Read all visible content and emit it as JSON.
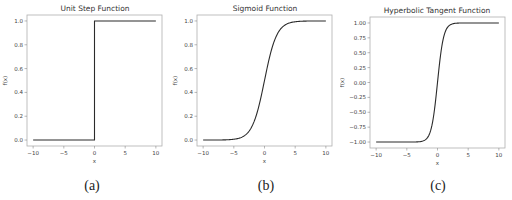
{
  "chart_data": [
    {
      "type": "line",
      "title": "Unit Step Function",
      "xlabel": "x",
      "ylabel": "f(x)",
      "xlim": [
        -10,
        10
      ],
      "ylim": [
        -0.05,
        1.05
      ],
      "xticks": [
        -10,
        -5,
        0,
        5,
        10
      ],
      "yticks": [
        0.0,
        0.2,
        0.4,
        0.6,
        0.8,
        1.0
      ],
      "ytick_labels": [
        "0.0",
        "0.2",
        "0.4",
        "0.6",
        "0.8",
        "1.0"
      ],
      "grid": false,
      "caption": "(a)",
      "series": [
        {
          "name": "step",
          "x": [
            -10,
            0,
            0,
            10
          ],
          "y": [
            0,
            0,
            1,
            1
          ]
        }
      ]
    },
    {
      "type": "line",
      "title": "Sigmoid Function",
      "xlabel": "x",
      "ylabel": "f(x)",
      "xlim": [
        -10,
        10
      ],
      "ylim": [
        -0.05,
        1.05
      ],
      "xticks": [
        -10,
        -5,
        0,
        5,
        10
      ],
      "yticks": [
        0.0,
        0.2,
        0.4,
        0.6,
        0.8,
        1.0
      ],
      "ytick_labels": [
        "0.0",
        "0.2",
        "0.4",
        "0.6",
        "0.8",
        "1.0"
      ],
      "grid": false,
      "caption": "(b)",
      "series": [
        {
          "name": "sigmoid",
          "function": "1/(1+exp(-x))",
          "x": [
            -10,
            -8,
            -6,
            -5,
            -4,
            -3,
            -2,
            -1,
            0,
            1,
            2,
            3,
            4,
            5,
            6,
            8,
            10
          ],
          "y": [
            0.0,
            0.0003,
            0.0025,
            0.0067,
            0.018,
            0.047,
            0.119,
            0.269,
            0.5,
            0.731,
            0.881,
            0.953,
            0.982,
            0.993,
            0.9975,
            0.9997,
            1.0
          ]
        }
      ]
    },
    {
      "type": "line",
      "title": "Hyperbolic Tangent Function",
      "xlabel": "x",
      "ylabel": "f(x)",
      "xlim": [
        -10,
        10
      ],
      "ylim": [
        -1.1,
        1.1
      ],
      "xticks": [
        -10,
        -5,
        0,
        5,
        10
      ],
      "yticks": [
        -1.0,
        -0.75,
        -0.5,
        -0.25,
        0.0,
        0.25,
        0.5,
        0.75,
        1.0
      ],
      "ytick_labels": [
        "−1.00",
        "−0.75",
        "−0.50",
        "−0.25",
        "0.00",
        "0.25",
        "0.50",
        "0.75",
        "1.00"
      ],
      "grid": false,
      "caption": "(c)",
      "series": [
        {
          "name": "tanh",
          "function": "tanh(x)",
          "x": [
            -10,
            -4,
            -3,
            -2,
            -1.5,
            -1,
            -0.5,
            0,
            0.5,
            1,
            1.5,
            2,
            3,
            4,
            10
          ],
          "y": [
            -1.0,
            -0.999,
            -0.995,
            -0.964,
            -0.905,
            -0.762,
            -0.462,
            0,
            0.462,
            0.762,
            0.905,
            0.964,
            0.995,
            0.999,
            1.0
          ]
        }
      ]
    }
  ],
  "xtick_labels": [
    "−10",
    "−5",
    "0",
    "5",
    "10"
  ]
}
